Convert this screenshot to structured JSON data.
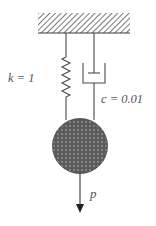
{
  "diagram": {
    "spring_label": "k = 1",
    "damper_label": "c = 0.01",
    "force_label": "p",
    "colors": {
      "line": "#4a4a4a",
      "hatch": "#555555",
      "mass_fill": "#5a5a5a",
      "mass_dots": "#b8b8b8",
      "text": "#555555"
    }
  }
}
